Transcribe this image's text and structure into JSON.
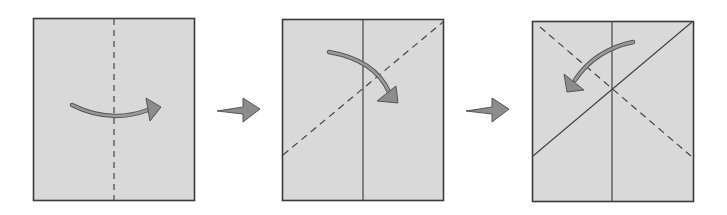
{
  "diagram": {
    "colors": {
      "paper_fill": "#d9d9d9",
      "paper_stroke": "#3a3a3a",
      "crease_line": "#444444",
      "arrow_fill": "#8c8c8c",
      "arrow_stroke": "#555555"
    },
    "steps": [
      {
        "label": "Step 1",
        "description": "Fold in half along the vertical center dashed line, left to right"
      },
      {
        "label": "Step 2",
        "description": "Fold along the diagonal dashed line, top-left down to the right"
      },
      {
        "label": "Step 3",
        "description": "Fold along the opposite diagonal dashed line, top-right down to the left"
      }
    ],
    "transition_arrows": [
      "arrow-step1-to-step2",
      "arrow-step2-to-step3"
    ]
  }
}
